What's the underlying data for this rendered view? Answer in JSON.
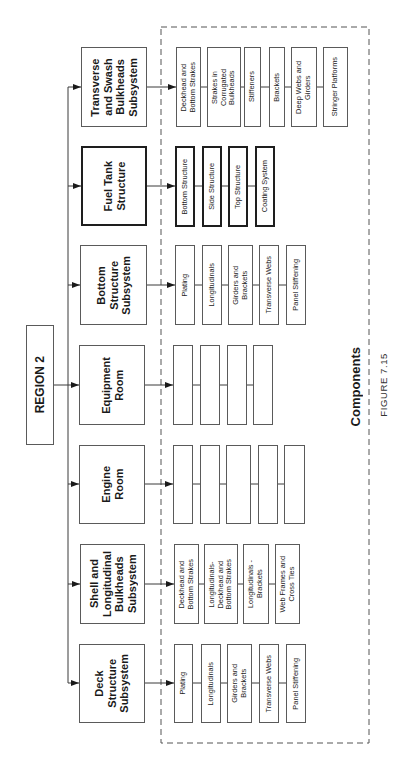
{
  "region": {
    "label": "REGION 2"
  },
  "subsystems": [
    {
      "label": "Transverse\nand Swash\nBulkheads\nSubsystem",
      "components": [
        "Deckhead and\nBottom Strakes",
        "Strakes in\nCorrugated\nBulkheads",
        "Stiffeners",
        "Brackets",
        "Deep Webs and\nGirders",
        "Stringer Platforms"
      ]
    },
    {
      "label": "Fuel Tank\nStructure",
      "components": [
        "Bottom  Structure",
        "Side  Structure",
        "Top Structure",
        "Coating System"
      ]
    },
    {
      "label": "Bottom\nStructure\nSubsystem",
      "components": [
        "Plating",
        "Longitudinals",
        "Girders and\nBrackets",
        "Transverse Webs",
        "Panel Stiffening"
      ]
    },
    {
      "label": "Equipment\nRoom",
      "components": [
        "",
        "",
        "",
        ""
      ]
    },
    {
      "label": "Engine\nRoom",
      "components": [
        "",
        "",
        "",
        "",
        ""
      ]
    },
    {
      "label": "Shell and\nLongitudinal\nBulkheads\nSubsystem",
      "components": [
        "Deckhead and\nBottom Strakes",
        "Longitudinals-\nDeckhead and\nBottom Strakes",
        "Longitudinals -\nBrackets",
        "Web Frames and\nCross Ties"
      ]
    },
    {
      "label": "Deck\nStructure\nSubsystem",
      "components": [
        "Plating",
        "Longitudinals",
        "Girders and\nBrackets",
        "Transverse Webs",
        "Panel Stiffening"
      ]
    }
  ],
  "components_group_label": "Components",
  "figure_caption": "FIGURE 7.15",
  "colors": {
    "line": "#3a3a3a",
    "box_border": "#5a5a5a",
    "text": "#1a1a1a",
    "background": "#ffffff"
  }
}
